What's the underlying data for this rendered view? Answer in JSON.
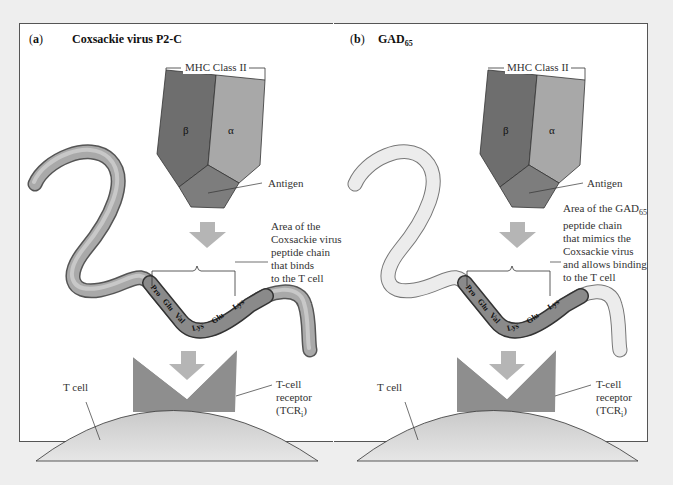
{
  "panels": [
    {
      "letter_open": "(",
      "letter": "a",
      "letter_close": ")",
      "title": "Coxsackie virus P2-C",
      "mhc_label": "MHC Class II",
      "beta": "β",
      "alpha": "α",
      "antigen_label": "Antigen",
      "area_label_lines": [
        "Area of the",
        "Coxsackie virus",
        "peptide chain",
        "that binds",
        "to the T cell"
      ],
      "residues": [
        "Pro",
        "Glu",
        "Val",
        "Lys",
        "Glu",
        "Lys"
      ],
      "tcell_label": "T cell",
      "tcr_label_lines": [
        "T-cell",
        "receptor",
        "(TCR"
      ],
      "tcr_sub": "i",
      "chain_color": "#a9a9a9"
    },
    {
      "letter_open": "(",
      "letter": "b",
      "letter_close": ")",
      "title": "GAD",
      "title_sub": "65",
      "mhc_label": "MHC Class II",
      "beta": "β",
      "alpha": "α",
      "antigen_label": "Antigen",
      "area_label_first": "Area of the GAD",
      "area_label_first_sub": "65",
      "area_label_lines": [
        "peptide chain",
        "that mimics the",
        "Coxsackie virus",
        "and allows binding",
        "to the T cell"
      ],
      "residues": [
        "Pro",
        "Glu",
        "Val",
        "Lys",
        "Glu",
        "Lys"
      ],
      "tcell_label": "T cell",
      "tcr_label_lines": [
        "T-cell",
        "receptor",
        "(TCR"
      ],
      "tcr_sub": "i",
      "chain_color": "#ececec"
    }
  ],
  "colors": {
    "beta": "#6e6e6e",
    "alpha": "#a8a8a8",
    "antigen": "#7d7d7d",
    "arrow": "#b5b5b5",
    "tcr": "#8e8e8e",
    "tcell": "#d2d2d2"
  }
}
